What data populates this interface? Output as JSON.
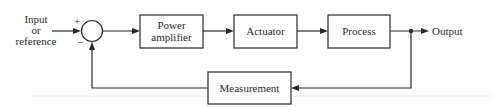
{
  "diagram": {
    "type": "feedback-control-block-diagram",
    "input_label_lines": [
      "Input",
      "or",
      "reference"
    ],
    "summing_junction": {
      "plus_sign": "+",
      "minus_sign": "−"
    },
    "blocks": [
      {
        "id": "power-amplifier",
        "label_lines": [
          "Power",
          "amplifier"
        ]
      },
      {
        "id": "actuator",
        "label_lines": [
          "Actuator"
        ]
      },
      {
        "id": "process",
        "label_lines": [
          "Process"
        ]
      },
      {
        "id": "measurement",
        "label_lines": [
          "Measurement"
        ]
      }
    ],
    "output_label": "Output",
    "colors": {
      "line": "#2a2a2a",
      "background": "#ffffff"
    }
  }
}
